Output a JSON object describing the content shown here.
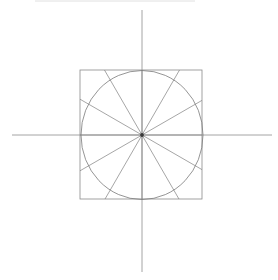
{
  "document": {
    "title": "Geometric construction: circle inscribed in square with 12 radial spokes",
    "width": 278,
    "height": 280,
    "background_color": "#ffffff"
  },
  "figure": {
    "name": "circle-in-square-radial-spokes",
    "center": {
      "x": 142,
      "y": 135
    },
    "colors": {
      "square_stroke": "#8a8a8a",
      "circle_stroke": "#7a7a7a",
      "spoke_stroke": "#808080",
      "axis_stroke": "#9a9a9a",
      "center_dot": "#3a3a3a",
      "artifact_stroke": "#d8d8d8"
    },
    "stroke_widths": {
      "square": 0.8,
      "circle": 0.8,
      "spoke": 0.7,
      "axis": 0.9,
      "artifact": 0.8
    }
  },
  "chart_data": {
    "type": "scatter",
    "title": "",
    "xlabel": "",
    "ylabel": "",
    "grid": false,
    "legend": null,
    "axes": {
      "horizontal": {
        "y": 135,
        "x_start": 12,
        "x_end": 272
      },
      "vertical": {
        "x": 142,
        "y_start": 10,
        "y_end": 272
      }
    },
    "square": {
      "left": 80,
      "top": 70,
      "right": 202,
      "bottom": 199,
      "width": 122,
      "height": 129
    },
    "circle": {
      "cx": 142,
      "cy": 135,
      "rx": 61,
      "ry": 64.5
    },
    "spokes": {
      "count": 12,
      "angles_deg": [
        0,
        30,
        60,
        90,
        120,
        150,
        180,
        210,
        240,
        270,
        300,
        330
      ],
      "note": "Each spoke runs from the center and terminates on the square boundary"
    },
    "artifact_line": {
      "y": 1,
      "x_start": 35,
      "x_end": 195
    }
  }
}
